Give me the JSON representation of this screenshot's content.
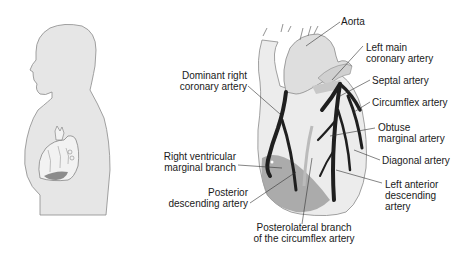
{
  "figure": {
    "left_panel": "Human torso silhouette with heart location",
    "right_panel": "Coronary arteries of the heart (anterior view)"
  },
  "labels": {
    "aorta": "Aorta",
    "left_main_1": "Left main",
    "left_main_2": "coronary artery",
    "septal": "Septal artery",
    "circumflex": "Circumflex artery",
    "obtuse_1": "Obtuse",
    "obtuse_2": "marginal artery",
    "diagonal": "Diagonal artery",
    "lad_1": "Left anterior",
    "lad_2": "descending",
    "lad_3": "artery",
    "drca_1": "Dominant right",
    "drca_2": "coronary artery",
    "rvmb_1": "Right ventricular",
    "rvmb_2": "marginal branch",
    "pda_1": "Posterior",
    "pda_2": "descending artery",
    "plb_1": "Posterolateral branch",
    "plb_2": "of the circumflex artery"
  },
  "colors": {
    "silhouette": "#e6e6e6",
    "outline": "#8a8a8a",
    "heart_fill": "#ececec",
    "artery": "#1f1f1f",
    "shaded_region": "#9a9a9a",
    "leader": "#333333"
  }
}
